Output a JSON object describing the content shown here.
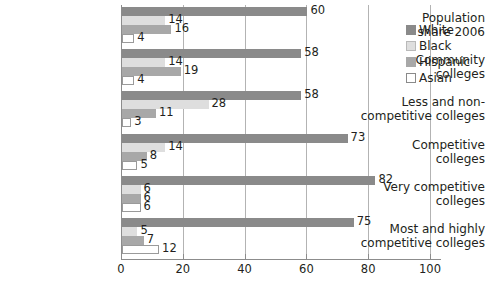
{
  "chart_data": {
    "type": "bar",
    "orientation": "horizontal",
    "title": "",
    "xlabel": "",
    "ylabel": "",
    "xlim": [
      0,
      100
    ],
    "xticks": [
      0,
      20,
      40,
      60,
      80,
      100
    ],
    "grid": true,
    "legend_position": "right",
    "categories": [
      "Population share 2006",
      "Community colleges",
      "Less and non-competitive colleges",
      "Competitive colleges",
      "Very competitive colleges",
      "Most and highly competitive colleges"
    ],
    "category_lines": [
      [
        "Population",
        "share 2006"
      ],
      [
        "Community",
        "colleges"
      ],
      [
        "Less and non-",
        "competitive colleges"
      ],
      [
        "Competitive",
        "colleges"
      ],
      [
        "Very competitive",
        "colleges"
      ],
      [
        "Most and highly",
        "competitive colleges"
      ]
    ],
    "series": [
      {
        "name": "White",
        "color": "#8a8a8a",
        "values": [
          60,
          58,
          58,
          73,
          82,
          75
        ]
      },
      {
        "name": "Black",
        "color": "#dedede",
        "values": [
          14,
          14,
          28,
          14,
          6,
          5
        ]
      },
      {
        "name": "Hispanic",
        "color": "#a8a8a8",
        "values": [
          16,
          19,
          11,
          8,
          6,
          7
        ]
      },
      {
        "name": "Asian",
        "color": "#ffffff",
        "values": [
          4,
          4,
          3,
          5,
          6,
          12
        ]
      }
    ]
  },
  "legend": {
    "items": [
      {
        "label": "White",
        "swatch": "white-s"
      },
      {
        "label": "Black",
        "swatch": "black-s"
      },
      {
        "label": "Hispanic",
        "swatch": "hispanic-s"
      },
      {
        "label": "Asian",
        "swatch": "asian-s"
      }
    ]
  },
  "axis": {
    "tick_labels": [
      "0",
      "20",
      "40",
      "60",
      "80",
      "100"
    ]
  }
}
